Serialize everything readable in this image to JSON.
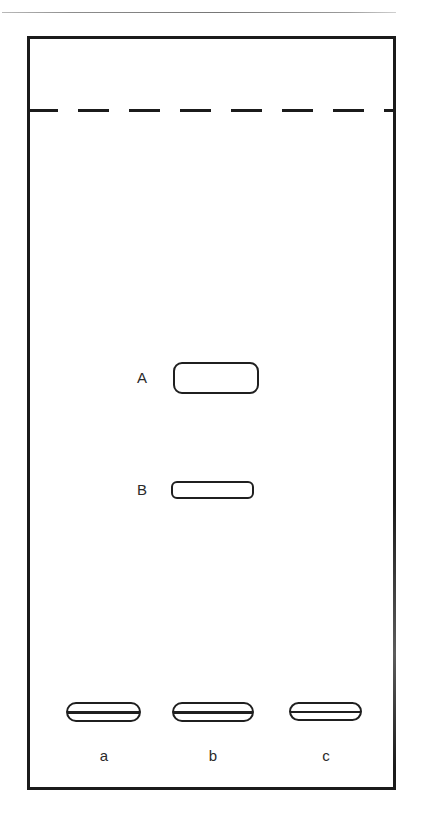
{
  "figure": {
    "kind": "tlc-plate-diagram",
    "background_color": "#ffffff",
    "ink_color": "#1b1b1b",
    "width": 424,
    "height": 816
  },
  "plate": {
    "border_color": "#1b1b1b",
    "fill_color": "#ffffff"
  },
  "solvent_front": {
    "style": "dashed",
    "label": ""
  },
  "spots": {
    "developed": [
      {
        "id": "A",
        "label": "A",
        "lane": "b",
        "shape": "rounded-band",
        "height_class": "tall"
      },
      {
        "id": "B",
        "label": "B",
        "lane": "b",
        "shape": "rounded-band",
        "height_class": "flat"
      }
    ],
    "origin": [
      {
        "id": "origin-a",
        "lane": "a",
        "shape": "banded-spot"
      },
      {
        "id": "origin-b",
        "lane": "b",
        "shape": "banded-spot"
      },
      {
        "id": "origin-c",
        "lane": "c",
        "shape": "banded-spot"
      }
    ]
  },
  "lanes": [
    {
      "id": "a",
      "label": "a"
    },
    {
      "id": "b",
      "label": "b"
    },
    {
      "id": "c",
      "label": "c"
    }
  ],
  "chart_data": {
    "type": "scatter",
    "title": "",
    "xlabel": "",
    "ylabel": "",
    "categories": [
      "a",
      "b",
      "c"
    ],
    "annotations": [
      "A",
      "B"
    ],
    "series": [
      {
        "name": "A",
        "values": [
          null,
          0.56,
          null
        ]
      },
      {
        "name": "B",
        "values": [
          null,
          0.4,
          null
        ]
      },
      {
        "name": "origin",
        "values": [
          0.0,
          0.0,
          0.0
        ]
      }
    ],
    "grid": false,
    "legend": "none"
  }
}
